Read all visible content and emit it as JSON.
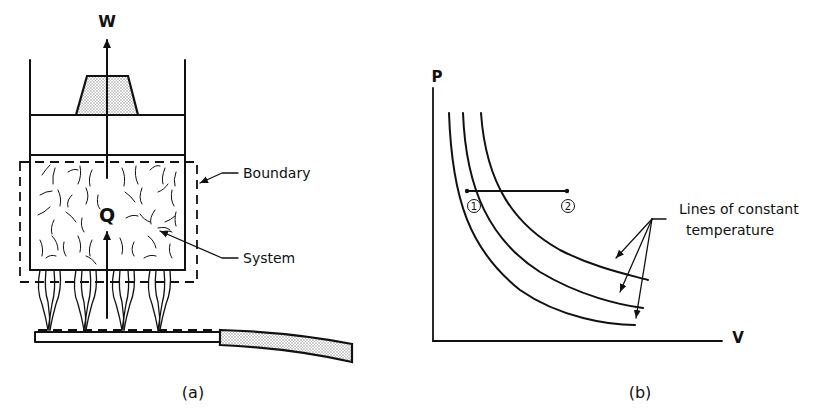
{
  "figure": {
    "panel_a": {
      "caption": "(a)",
      "labels": {
        "work": "W",
        "heat": "Q",
        "boundary": "Boundary",
        "system": "System"
      },
      "components": [
        "cylinder",
        "piston",
        "weight",
        "gas-system",
        "dashed-boundary",
        "burner-flames",
        "burner",
        "gas-hose"
      ]
    },
    "panel_b": {
      "caption": "(b)",
      "axes": {
        "y_label": "P",
        "x_label": "V"
      },
      "state_points": [
        {
          "label": "1"
        },
        {
          "label": "2"
        }
      ],
      "annotation_line1": "Lines of constant",
      "annotation_line2": "temperature",
      "isotherm_count": 3
    }
  },
  "colors": {
    "ink": "#111111",
    "background": "#ffffff",
    "stipple": "#9a9a9a"
  }
}
